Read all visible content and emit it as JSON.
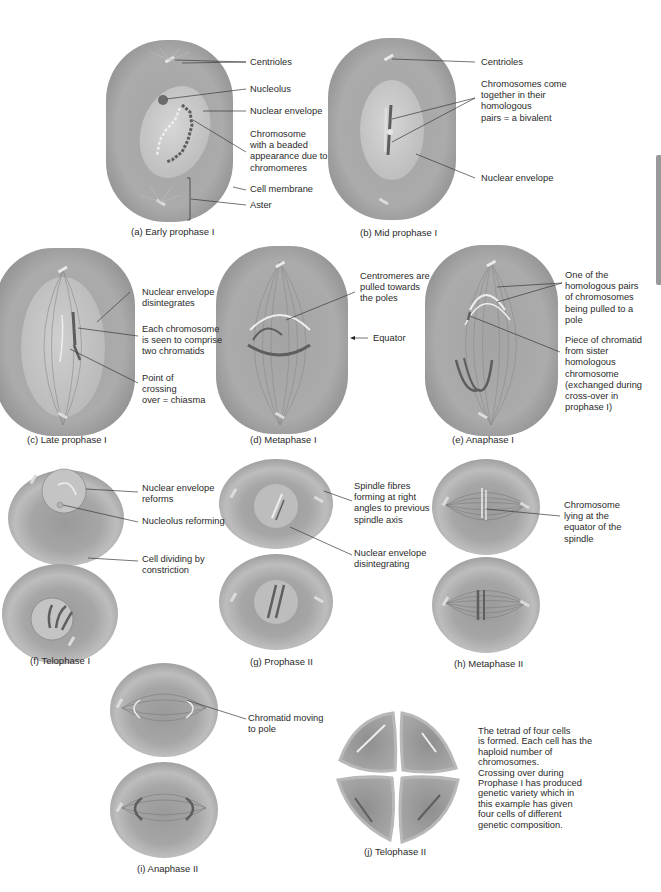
{
  "colors": {
    "cytoplasm": "#a9a9a9",
    "cytoplasm_dark": "#8e8e8e",
    "nucleus": "#c9c9c9",
    "chromosome_dark": "#5e5e5e",
    "chromosome_light": "#eeeeee",
    "leader_line": "#3a3a3a",
    "side_tab": "#9a9a9a"
  },
  "panels": [
    {
      "id": "a",
      "caption": "(a) Early prophase I",
      "labels": [
        "Centrioles",
        "Nucleolus",
        "Nuclear envelope",
        "Chromosome\nwith a beaded\nappearance due to\nchromomeres",
        "Cell membrane",
        "Aster"
      ]
    },
    {
      "id": "b",
      "caption": "(b) Mid prophase I",
      "labels": [
        "Centrioles",
        "Chromosomes come\ntogether in their\nhomologous\npairs = a bivalent",
        "Nuclear envelope"
      ]
    },
    {
      "id": "c",
      "caption": "(c) Late prophase I",
      "labels": [
        "Nuclear envelope\ndisintegrates",
        "Each chromosome\nis seen to comprise\ntwo chromatids",
        "Point of\ncrossing\nover = chiasma"
      ]
    },
    {
      "id": "d",
      "caption": "(d) Metaphase I",
      "labels": [
        "Centromeres are\npulled towards\nthe poles",
        "Equator"
      ]
    },
    {
      "id": "e",
      "caption": "(e) Anaphase I",
      "labels": [
        "One of the\nhomologous pairs\nof chromosomes\nbeing pulled to a\npole",
        "Piece of chromatid\nfrom sister\nhomologous\nchromosome\n(exchanged during\ncross-over in\nprophase I)"
      ]
    },
    {
      "id": "f",
      "caption": "(f) Telophase I",
      "labels": [
        "Nuclear envelope\nreforms",
        "Nucleolus reforming",
        "Cell dividing by\nconstriction"
      ]
    },
    {
      "id": "g",
      "caption": "(g) Prophase II",
      "labels": [
        "Spindle fibres\nforming at right\nangles to previous\nspindle axis",
        "Nuclear envelope\ndisintegrating"
      ]
    },
    {
      "id": "h",
      "caption": "(h) Metaphase II",
      "labels": [
        "Chromosome\nlying at the\nequator of the\nspindle"
      ]
    },
    {
      "id": "i",
      "caption": "(i) Anaphase II",
      "labels": [
        "Chromatid moving\nto pole"
      ]
    },
    {
      "id": "j",
      "caption": "(j) Telophase II",
      "labels": [
        "The tetrad of four cells\nis formed. Each cell has the\nhaploid number of\nchromosomes.\nCrossing over during\nProphase I has produced\ngenetic variety which in\nthis example has given\nfour cells of different\ngenetic composition."
      ]
    }
  ]
}
